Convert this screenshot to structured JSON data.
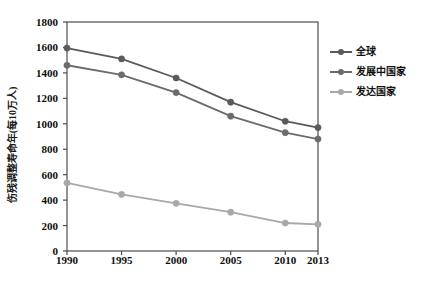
{
  "chart_data": {
    "type": "line",
    "title": "",
    "xlabel": "",
    "ylabel": "伤残调整寿命年(每10万人)",
    "categories": [
      "1990",
      "1995",
      "2000",
      "2005",
      "2010",
      "2013"
    ],
    "x": [
      1990,
      1995,
      2000,
      2005,
      2010,
      2013
    ],
    "ylim": [
      0,
      1800
    ],
    "yticks": [
      0,
      200,
      400,
      600,
      800,
      1000,
      1200,
      1400,
      1600,
      1800
    ],
    "ytick_labels": [
      "0",
      "200",
      "400",
      "600",
      "800",
      "1000",
      "1200",
      "1400",
      "1600",
      "1800"
    ],
    "grid": false,
    "legend_position": "right",
    "series": [
      {
        "name": "全球",
        "color": "#5a5a5a",
        "values": [
          1595,
          1510,
          1360,
          1170,
          1020,
          970
        ]
      },
      {
        "name": "发展中国家",
        "color": "#6b6b6b",
        "values": [
          1460,
          1385,
          1245,
          1060,
          930,
          880
        ]
      },
      {
        "name": "发达国家",
        "color": "#a8a8a8",
        "values": [
          535,
          445,
          375,
          305,
          220,
          210
        ]
      }
    ]
  },
  "axis": {
    "frame_color": "#4d4d4d",
    "tick_color": "#4d4d4d"
  }
}
